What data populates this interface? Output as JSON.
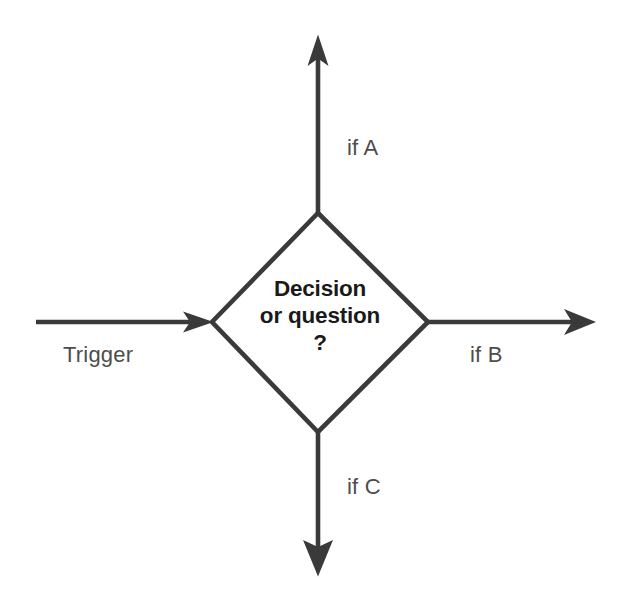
{
  "canvas": {
    "width": 617,
    "height": 605,
    "background": "#ffffff"
  },
  "style": {
    "stroke_color": "#3a3a3a",
    "stroke_width": 4.6,
    "node_text_color": "#1a1a1a",
    "label_text_color": "#4d4d4d"
  },
  "node": {
    "shape": "diamond",
    "name": "decision-node",
    "text_lines": [
      "Decision",
      "or question",
      "?"
    ],
    "geometry": {
      "center_x": 320,
      "center_y": 322,
      "half_width": 108,
      "half_height": 110
    }
  },
  "edges": [
    {
      "id": "trigger",
      "label": "Trigger",
      "direction": "incoming",
      "side": "left",
      "arrowhead": "barbed-right",
      "from_x": 36,
      "from_y": 322,
      "to_x": 212,
      "to_y": 322
    },
    {
      "id": "if-a",
      "label": "if A",
      "direction": "outgoing",
      "side": "top",
      "arrowhead": "barbed-up",
      "from_x": 318,
      "from_y": 213,
      "to_x": 318,
      "to_y": 35
    },
    {
      "id": "if-b",
      "label": "if B",
      "direction": "outgoing",
      "side": "right",
      "arrowhead": "swept-right",
      "from_x": 428,
      "from_y": 322,
      "to_x": 596,
      "to_y": 322
    },
    {
      "id": "if-c",
      "label": "if C",
      "direction": "outgoing",
      "side": "bottom",
      "arrowhead": "triangle-down",
      "from_x": 318,
      "from_y": 432,
      "to_x": 318,
      "to_y": 576
    }
  ]
}
